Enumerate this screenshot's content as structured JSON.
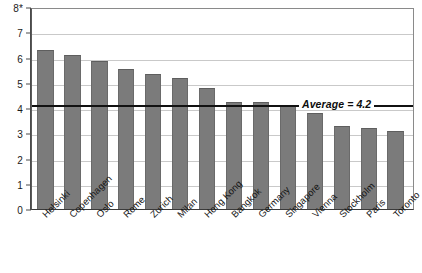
{
  "chart_data": {
    "type": "bar",
    "title": "",
    "xlabel": "",
    "ylabel": "",
    "ylim": [
      0,
      8
    ],
    "grid": true,
    "legend": "none",
    "categories": [
      "Helsinki",
      "Copenhagen",
      "Oslo",
      "Rome",
      "Zurich",
      "Milan",
      "Hong Kong",
      "Bangkok",
      "Germany",
      "Singapore",
      "Vienna",
      "Stockholm",
      "Paris",
      "Toronto"
    ],
    "values": [
      6.3,
      6.1,
      5.85,
      5.55,
      5.35,
      5.2,
      4.8,
      4.25,
      4.25,
      4.1,
      3.8,
      3.3,
      3.2,
      3.1
    ],
    "ytick_labels": [
      "8*",
      "7",
      "6",
      "5",
      "4",
      "3",
      "2",
      "1",
      "0"
    ],
    "ytick_values": [
      8,
      7,
      6,
      5,
      4,
      3,
      2,
      1,
      0
    ],
    "annotations": [
      {
        "name": "average-line",
        "label": "Average = 4.2",
        "value": 4.2
      }
    ],
    "colors": {
      "bar_fill": "#7b7b7b",
      "gridline": "#c9c9c9",
      "average_line": "#111111",
      "axis": "#3a3a3a",
      "background": "#ffffff"
    }
  }
}
